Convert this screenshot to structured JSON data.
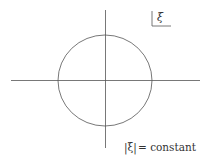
{
  "diagram": {
    "corner_label": "ξ",
    "bottom_label": {
      "prefix": "|ξ|",
      "suffix": "= constant"
    },
    "colors": {
      "stroke": "#555555",
      "text": "#333333",
      "background": "#ffffff"
    },
    "circle": {
      "cx": 105,
      "cy": 80.5,
      "rx": 47,
      "ry": 45.5
    },
    "axes": {
      "horizontal": {
        "x1": 11,
        "x2": 200,
        "y": 80.5
      },
      "vertical": {
        "x": 105.5,
        "y1": 10,
        "y2": 148
      }
    }
  }
}
